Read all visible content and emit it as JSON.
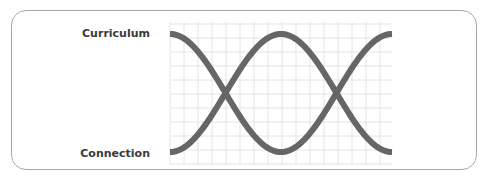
{
  "diagram": {
    "top_label": "Curriculum",
    "bottom_label": "Connection",
    "curves": [
      {
        "name": "curriculum-curve",
        "start": "top",
        "periods": 1
      },
      {
        "name": "connection-curve",
        "start": "bottom",
        "periods": 1
      }
    ],
    "colors": {
      "curve": "#666666",
      "grid": "#e4e4e4",
      "border": "#a8a8a8",
      "text": "#3a3a3a"
    }
  }
}
